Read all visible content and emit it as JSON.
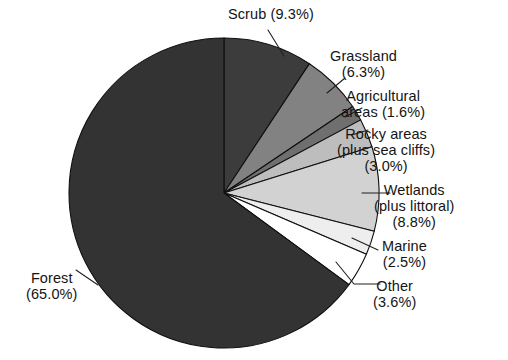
{
  "chart_data": {
    "type": "pie",
    "title": "",
    "subtitle": "",
    "xlabel": "",
    "ylabel": "",
    "legend_position": "none",
    "grid": false,
    "units": "percent",
    "start_angle_deg": 0,
    "direction": "clockwise",
    "categories": [
      "Scrub",
      "Grassland",
      "Agricultural areas",
      "Rocky areas (plus sea cliffs)",
      "Wetlands (plus littoral)",
      "Marine",
      "Other",
      "Forest"
    ],
    "values": [
      9.3,
      6.3,
      1.6,
      3.0,
      8.8,
      2.5,
      3.6,
      65.0
    ],
    "slices": [
      {
        "name": "Scrub",
        "value": 9.3,
        "value_text": "(9.3%)",
        "label_lines": [
          "Scrub (9.3%)"
        ],
        "color": "#3c3c3c"
      },
      {
        "name": "Grassland",
        "value": 6.3,
        "value_text": "(6.3%)",
        "label_lines": [
          "Grassland",
          "(6.3%)"
        ],
        "color": "#828282"
      },
      {
        "name": "Agricultural areas",
        "value": 1.6,
        "value_text": "(1.6%)",
        "label_lines": [
          "Agricultural",
          "areas (1.6%)"
        ],
        "color": "#6f6f6f"
      },
      {
        "name": "Rocky areas (plus sea cliffs)",
        "value": 3.0,
        "value_text": "(3.0%)",
        "label_lines": [
          "Rocky areas",
          "(plus sea cliffs)",
          "(3.0%)"
        ],
        "color": "#bdbdbd"
      },
      {
        "name": "Wetlands (plus littoral)",
        "value": 8.8,
        "value_text": "(8.8%)",
        "label_lines": [
          "Wetlands",
          "(plus littoral)",
          "(8.8%)"
        ],
        "color": "#d2d2d2"
      },
      {
        "name": "Marine",
        "value": 2.5,
        "value_text": "(2.5%)",
        "label_lines": [
          "Marine",
          "(2.5%)"
        ],
        "color": "#eeeeee"
      },
      {
        "name": "Other",
        "value": 3.6,
        "value_text": "(3.6%)",
        "label_lines": [
          "Other",
          "(3.6%)"
        ],
        "color": "#ffffff"
      },
      {
        "name": "Forest",
        "value": 65.0,
        "value_text": "(65.0%)",
        "label_lines": [
          "Forest",
          "(65.0%)"
        ],
        "color": "#333333"
      }
    ]
  },
  "labels": {
    "scrub": {
      "l1": "Scrub (9.3%)"
    },
    "grass": {
      "l1": "Grassland",
      "l2": "(6.3%)"
    },
    "agri": {
      "l1": "Agricultural",
      "l2": "areas (1.6%)"
    },
    "rocky": {
      "l1": "Rocky areas",
      "l2": "(plus sea cliffs)",
      "l3": "(3.0%)"
    },
    "wet": {
      "l1": "Wetlands",
      "l2": "(plus littoral)",
      "l3": "(8.8%)"
    },
    "marine": {
      "l1": "Marine",
      "l2": "(2.5%)"
    },
    "other": {
      "l1": "Other",
      "l2": "(3.6%)"
    },
    "forest": {
      "l1": "Forest",
      "l2": "(65.0%)"
    }
  },
  "geometry": {
    "center_x": 224,
    "center_y": 193,
    "radius": 155
  },
  "colors": {
    "outline": "#101010",
    "text": "#141414",
    "background": "#ffffff"
  }
}
